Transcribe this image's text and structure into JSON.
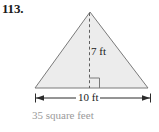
{
  "problem": {
    "number": "113."
  },
  "figure": {
    "type": "triangle",
    "shape_name": "isosceles-triangle",
    "fill_color": "#ececec",
    "stroke_color": "#7a7a7a",
    "dashed_line_name": "height-dashed-line",
    "right_angle_marker_name": "right-angle-marker",
    "height_label": "7 ft",
    "base_label": "10 ft",
    "height_value": 7,
    "base_value": 10,
    "units": "ft"
  },
  "answer": {
    "text": "35 square feet",
    "value": 35,
    "units": "square feet",
    "color": "#9a9a9a"
  }
}
